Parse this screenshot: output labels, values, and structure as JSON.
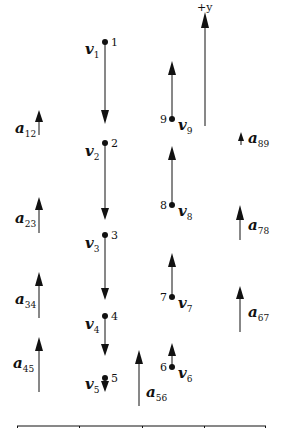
{
  "diagram": {
    "type": "motion-diagram",
    "axis_label": "+y",
    "colors": {
      "ink": "#111111",
      "background": "#ffffff"
    },
    "points": [
      {
        "n": "1",
        "v_label": "v",
        "v_sub": "1"
      },
      {
        "n": "2",
        "v_label": "v",
        "v_sub": "2"
      },
      {
        "n": "3",
        "v_label": "v",
        "v_sub": "3"
      },
      {
        "n": "4",
        "v_label": "v",
        "v_sub": "4"
      },
      {
        "n": "5",
        "v_label": "v",
        "v_sub": "5"
      },
      {
        "n": "6",
        "v_label": "v",
        "v_sub": "6"
      },
      {
        "n": "7",
        "v_label": "v",
        "v_sub": "7"
      },
      {
        "n": "8",
        "v_label": "v",
        "v_sub": "8"
      },
      {
        "n": "9",
        "v_label": "v",
        "v_sub": "9"
      }
    ],
    "accelerations": [
      {
        "label": "a",
        "sub": "12"
      },
      {
        "label": "a",
        "sub": "23"
      },
      {
        "label": "a",
        "sub": "34"
      },
      {
        "label": "a",
        "sub": "45"
      },
      {
        "label": "a",
        "sub": "56"
      },
      {
        "label": "a",
        "sub": "67"
      },
      {
        "label": "a",
        "sub": "78"
      },
      {
        "label": "a",
        "sub": "89"
      }
    ],
    "ground_ticks": 5
  }
}
